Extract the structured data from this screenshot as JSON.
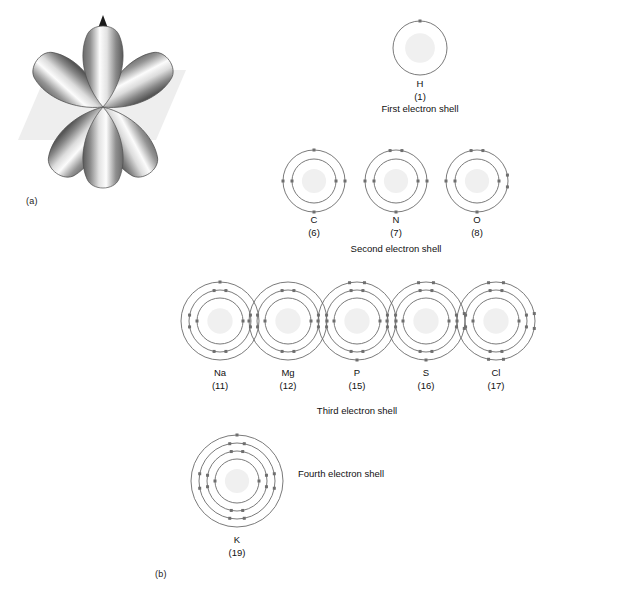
{
  "figure": {
    "panel_a_label": "(a)",
    "panel_b_label": "(b)"
  },
  "orbital": {
    "name": "p-orbital-lobes",
    "lobe_count": 6,
    "axis": "vertical-arrow",
    "plane_color": "#eeeeee",
    "lobe_dark": "#5d5d5d",
    "lobe_light": "#ffffff"
  },
  "shell_rows": [
    {
      "id": "first",
      "row_label": "First electron shell",
      "row_label_x": 420,
      "row_label_y": 103,
      "atoms": [
        {
          "symbol": "H",
          "number": "(1)",
          "cx": 420,
          "cy": 48,
          "shells": [
            1
          ],
          "radii": [
            27
          ],
          "label_y": 78
        }
      ]
    },
    {
      "id": "second",
      "row_label": "Second electron shell",
      "row_label_x": 396,
      "row_label_y": 243,
      "atoms": [
        {
          "symbol": "C",
          "number": "(6)",
          "cx": 314,
          "cy": 181,
          "shells": [
            2,
            4
          ],
          "radii": [
            22,
            31
          ],
          "label_y": 214
        },
        {
          "symbol": "N",
          "number": "(7)",
          "cx": 396,
          "cy": 181,
          "shells": [
            2,
            5
          ],
          "radii": [
            22,
            31
          ],
          "label_y": 214
        },
        {
          "symbol": "O",
          "number": "(8)",
          "cx": 477,
          "cy": 181,
          "shells": [
            2,
            6
          ],
          "radii": [
            22,
            31
          ],
          "label_y": 214
        }
      ]
    },
    {
      "id": "third",
      "row_label": "Third electron shell",
      "row_label_x": 357,
      "row_label_y": 405,
      "atoms": [
        {
          "symbol": "Na",
          "number": "(11)",
          "cx": 220,
          "cy": 321,
          "shells": [
            2,
            8,
            1
          ],
          "radii": [
            23,
            31,
            39
          ],
          "label_y": 367
        },
        {
          "symbol": "Mg",
          "number": "(12)",
          "cx": 288,
          "cy": 321,
          "shells": [
            2,
            8,
            2
          ],
          "radii": [
            23,
            31,
            39
          ],
          "label_y": 367
        },
        {
          "symbol": "P",
          "number": "(15)",
          "cx": 357,
          "cy": 321,
          "shells": [
            2,
            8,
            5
          ],
          "radii": [
            23,
            31,
            39
          ],
          "label_y": 367
        },
        {
          "symbol": "S",
          "number": "(16)",
          "cx": 426,
          "cy": 321,
          "shells": [
            2,
            8,
            6
          ],
          "radii": [
            23,
            31,
            39
          ],
          "label_y": 367
        },
        {
          "symbol": "Cl",
          "number": "(17)",
          "cx": 496,
          "cy": 321,
          "shells": [
            2,
            8,
            7
          ],
          "radii": [
            23,
            31,
            39
          ],
          "label_y": 367
        }
      ]
    },
    {
      "id": "fourth",
      "row_label": "Fourth electron shell",
      "row_label_side": true,
      "row_label_x": 298,
      "row_label_y": 468,
      "atoms": [
        {
          "symbol": "K",
          "number": "(19)",
          "cx": 237,
          "cy": 481,
          "shells": [
            2,
            8,
            8,
            1
          ],
          "radii": [
            22,
            30,
            38,
            46
          ],
          "label_y": 534
        }
      ]
    }
  ],
  "style": {
    "ring_stroke": "#6b6b6b",
    "electron_fill": "#6f6f6f",
    "nucleus_fill": "#f0f0f0"
  }
}
